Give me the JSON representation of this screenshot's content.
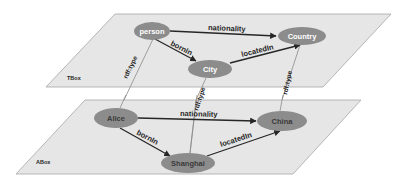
{
  "diagram": {
    "planes": {
      "tbox": {
        "label": "TBox"
      },
      "abox": {
        "label": "ABox"
      }
    },
    "tbox_nodes": {
      "person": {
        "label": "person"
      },
      "country": {
        "label": "Country"
      },
      "city": {
        "label": "City"
      }
    },
    "abox_nodes": {
      "alice": {
        "label": "Alice"
      },
      "china": {
        "label": "China"
      },
      "shanghai": {
        "label": "Shanghai"
      }
    },
    "tbox_edges": {
      "person_country": {
        "label": "nationality",
        "from": "person",
        "to": "Country"
      },
      "person_city": {
        "label": "bornIn",
        "from": "person",
        "to": "City"
      },
      "city_country": {
        "label": "locatedIn",
        "from": "City",
        "to": "Country"
      }
    },
    "abox_edges": {
      "alice_china": {
        "label": "nationality",
        "from": "Alice",
        "to": "China"
      },
      "alice_shanghai": {
        "label": "bornIn",
        "from": "Alice",
        "to": "Shanghai"
      },
      "shanghai_china": {
        "label": "locatedIn",
        "from": "Shanghai",
        "to": "China"
      }
    },
    "type_edges": {
      "alice_person": {
        "label": "rdf:type",
        "from": "Alice",
        "to": "person"
      },
      "shanghai_city": {
        "label": "rdf:type",
        "from": "Shanghai",
        "to": "City"
      },
      "china_country": {
        "label": "rdf:type",
        "from": "China",
        "to": "Country"
      }
    },
    "colors": {
      "plane_fill": "#e6e6e6",
      "plane_stroke": "#a6a6a6",
      "node_fill": "#8c8c8c",
      "edge": "#262626"
    }
  }
}
